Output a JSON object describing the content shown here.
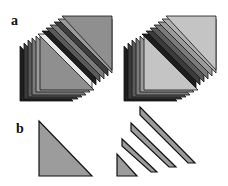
{
  "figure": {
    "panels": [
      {
        "label": "a",
        "description": "Two sets of stacked triangular layers (lower-left and upper-right stacks separated by a diagonal gap)"
      },
      {
        "label": "b",
        "description": "Single triangle (left) and triangle divided into diagonal strips (right)"
      }
    ],
    "colors": {
      "fill_dark_set": "#8f8f8f",
      "fill_light_set": "#c4c4c4",
      "layer_shades": [
        "#1e1e1e",
        "#3c3c3c",
        "#5a5a5a",
        "#7a7a7a",
        "#9a9a9a"
      ],
      "stroke": "#111111",
      "panel_b_fill": "#9c9c9c"
    }
  }
}
